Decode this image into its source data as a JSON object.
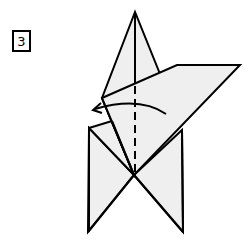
{
  "step": {
    "number": "3"
  },
  "colors": {
    "paper": "#efefef",
    "line": "#000000",
    "background": "#ffffff"
  },
  "diagram": {
    "fold_line": "valley-fold-dashed-vertical",
    "arrow": "curved-fold-arrow-left"
  }
}
